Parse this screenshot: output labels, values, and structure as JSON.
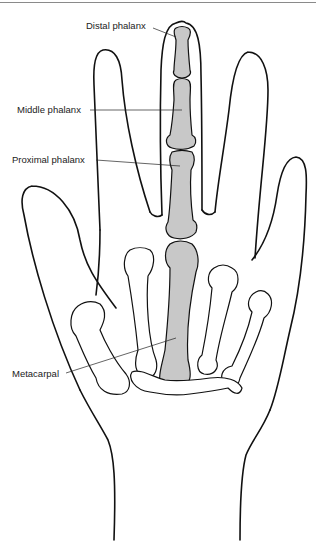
{
  "figure": {
    "highlight_color": "#c8c8c8",
    "outline_color": "#111111",
    "background": "#ffffff"
  },
  "labels": {
    "distal": "Distal phalanx",
    "middle": "Middle phalanx",
    "proximal": "Proximal phalanx",
    "metacarpal": "Metacarpal"
  }
}
